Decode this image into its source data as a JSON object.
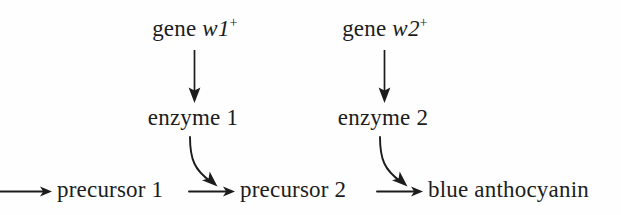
{
  "diagram": {
    "background_color": "#fefefe",
    "stroke_color": "#1c1c1c",
    "genes": [
      {
        "prefix": "gene ",
        "symbol": "w1",
        "superscript": "+"
      },
      {
        "prefix": "gene ",
        "symbol": "w2",
        "superscript": "+"
      }
    ],
    "enzymes": [
      {
        "label": "enzyme 1"
      },
      {
        "label": "enzyme 2"
      }
    ],
    "pathway": [
      {
        "label": "precursor 1"
      },
      {
        "label": "precursor 2"
      },
      {
        "label": "blue anthocyanin"
      }
    ],
    "arrows": {
      "gene_to_enzyme_1": "vertical-arrow-down",
      "gene_to_enzyme_2": "vertical-arrow-down",
      "enzyme1_to_step1": "curved-arrow-down-right",
      "enzyme2_to_step2": "curved-arrow-down-right",
      "inflow": "horizontal-arrow-right",
      "precursor1_to_precursor2": "horizontal-arrow-right",
      "precursor2_to_product": "horizontal-arrow-right"
    }
  }
}
